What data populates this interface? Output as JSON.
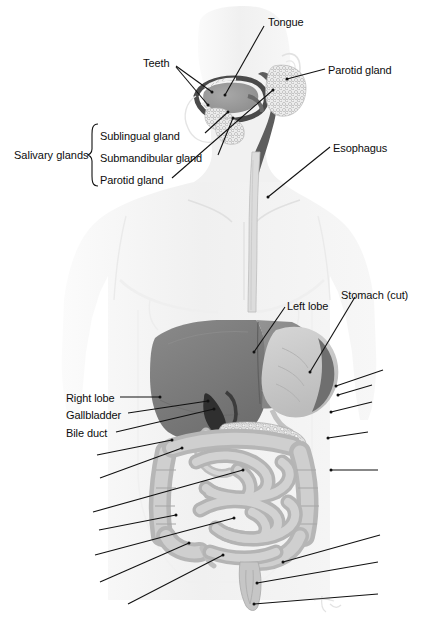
{
  "figure": {
    "background_color": "#ffffff",
    "line_color": "#111111",
    "text_color": "#0d0d0d",
    "organ_colors": {
      "liver": "#7d7d7d",
      "liver_left_lobe": "#8c8c8c",
      "stomach": "#c9c9c9",
      "stomach_cut_interior": "#6f6f6f",
      "intestine": "#bdbdbd",
      "pancreas": "#d8d8d8",
      "gallbladder": "#3a3a3a",
      "body_silhouette": "#f2f2f2",
      "tongue": "#9a9a9a",
      "teeth": "#e8e8e8",
      "esophagus": "#d4d4d4"
    }
  },
  "labels": {
    "tongue": "Tongue",
    "teeth": "Teeth",
    "parotid_gland_right": "Parotid gland",
    "esophagus": "Esophagus",
    "salivary_glands_group": "Salivary glands",
    "sublingual_gland": "Sublingual gland",
    "submandibular_gland": "Submandibular gland",
    "parotid_gland_list": "Parotid gland",
    "left_lobe": "Left lobe",
    "stomach_cut": "Stomach (cut)",
    "right_lobe": "Right lobe",
    "gallbladder": "Gallbladder",
    "bile_duct": "Bile duct"
  },
  "label_positions": {
    "tongue": {
      "x": 268,
      "y": 16
    },
    "teeth": {
      "x": 143,
      "y": 57
    },
    "parotid_gland_right": {
      "x": 328,
      "y": 64
    },
    "esophagus": {
      "x": 333,
      "y": 142
    },
    "salivary_glands_group": {
      "x": 14,
      "y": 149
    },
    "sublingual_gland": {
      "x": 100,
      "y": 130
    },
    "submandibular_gland": {
      "x": 100,
      "y": 152
    },
    "parotid_gland_list": {
      "x": 100,
      "y": 174
    },
    "left_lobe": {
      "x": 287,
      "y": 300
    },
    "stomach_cut": {
      "x": 341,
      "y": 289
    },
    "right_lobe": {
      "x": 66,
      "y": 392
    },
    "gallbladder": {
      "x": 66,
      "y": 409
    },
    "bile_duct": {
      "x": 66,
      "y": 427
    }
  },
  "leader_lines": [
    {
      "name": "tongue",
      "x1": 264,
      "y1": 26,
      "x2": 225,
      "y2": 95
    },
    {
      "name": "teeth-upper",
      "x1": 176,
      "y1": 66,
      "x2": 212,
      "y2": 92
    },
    {
      "name": "teeth-lower",
      "x1": 176,
      "y1": 67,
      "x2": 208,
      "y2": 105
    },
    {
      "name": "parotid-gland-right",
      "x1": 325,
      "y1": 69,
      "x2": 287,
      "y2": 79
    },
    {
      "name": "esophagus",
      "x1": 330,
      "y1": 147,
      "x2": 268,
      "y2": 197
    },
    {
      "name": "sublingual-gland",
      "x1": 205,
      "y1": 133,
      "x2": 228,
      "y2": 112
    },
    {
      "name": "submandibular-gland",
      "x1": 218,
      "y1": 155,
      "x2": 233,
      "y2": 118
    },
    {
      "name": "parotid-gland-list",
      "x1": 172,
      "y1": 178,
      "x2": 273,
      "y2": 90
    },
    {
      "name": "left-lobe",
      "x1": 285,
      "y1": 307,
      "x2": 254,
      "y2": 352
    },
    {
      "name": "stomach-cut",
      "x1": 355,
      "y1": 297,
      "x2": 310,
      "y2": 372
    },
    {
      "name": "right-lobe",
      "x1": 120,
      "y1": 397,
      "x2": 160,
      "y2": 397
    },
    {
      "name": "gallbladder",
      "x1": 128,
      "y1": 413,
      "x2": 208,
      "y2": 401
    },
    {
      "name": "bile-duct",
      "x1": 116,
      "y1": 432,
      "x2": 214,
      "y2": 409
    },
    {
      "name": "unlabeled-l1",
      "x1": 97,
      "y1": 455,
      "x2": 172,
      "y2": 440
    },
    {
      "name": "unlabeled-l2",
      "x1": 100,
      "y1": 478,
      "x2": 182,
      "y2": 448
    },
    {
      "name": "unlabeled-l3",
      "x1": 93,
      "y1": 512,
      "x2": 243,
      "y2": 470
    },
    {
      "name": "unlabeled-l4",
      "x1": 99,
      "y1": 530,
      "x2": 176,
      "y2": 515
    },
    {
      "name": "unlabeled-l5",
      "x1": 95,
      "y1": 555,
      "x2": 234,
      "y2": 518
    },
    {
      "name": "unlabeled-l6",
      "x1": 100,
      "y1": 582,
      "x2": 189,
      "y2": 543
    },
    {
      "name": "unlabeled-l7",
      "x1": 128,
      "y1": 604,
      "x2": 223,
      "y2": 555
    },
    {
      "name": "unlabeled-r1",
      "x1": 383,
      "y1": 370,
      "x2": 336,
      "y2": 386
    },
    {
      "name": "unlabeled-r2",
      "x1": 372,
      "y1": 385,
      "x2": 338,
      "y2": 395
    },
    {
      "name": "unlabeled-r3",
      "x1": 372,
      "y1": 402,
      "x2": 331,
      "y2": 412
    },
    {
      "name": "unlabeled-r4",
      "x1": 368,
      "y1": 432,
      "x2": 328,
      "y2": 438
    },
    {
      "name": "unlabeled-r5",
      "x1": 378,
      "y1": 470,
      "x2": 331,
      "y2": 470
    },
    {
      "name": "unlabeled-r6",
      "x1": 380,
      "y1": 535,
      "x2": 283,
      "y2": 562
    },
    {
      "name": "unlabeled-r7",
      "x1": 378,
      "y1": 562,
      "x2": 257,
      "y2": 583
    },
    {
      "name": "unlabeled-r8",
      "x1": 378,
      "y1": 594,
      "x2": 254,
      "y2": 604
    }
  ],
  "brace": {
    "name": "salivary-glands-brace",
    "x": 92,
    "y_top": 124,
    "y_bottom": 186
  },
  "signature": {
    "present": true,
    "x": 318,
    "y": 604
  }
}
